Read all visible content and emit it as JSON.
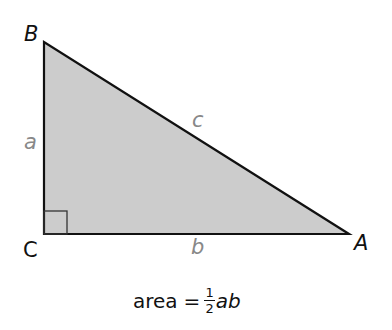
{
  "diagram": {
    "type": "right-triangle",
    "fill_color": "#cccccc",
    "stroke_color": "#111111",
    "side_label_color": "#888888",
    "vertices": {
      "B": {
        "label": "B"
      },
      "C": {
        "label": "C"
      },
      "A": {
        "label": "A"
      }
    },
    "sides": {
      "a": {
        "label": "a"
      },
      "b": {
        "label": "b"
      },
      "c": {
        "label": "c"
      }
    },
    "right_angle_at": "C"
  },
  "formula": {
    "lhs": "area",
    "equals": "=",
    "numerator": "1",
    "denominator": "2",
    "rhs_vars": "ab"
  }
}
